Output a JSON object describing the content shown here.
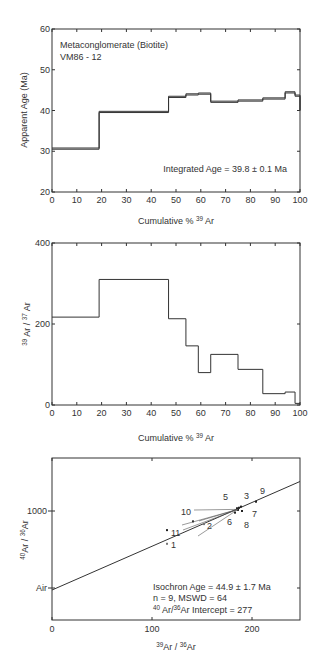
{
  "chart_data": [
    {
      "type": "line",
      "subtype": "step",
      "title": "",
      "annotation_lines": [
        "Metaconglomerate (Biotite)",
        "VM86 - 12"
      ],
      "annotation_result": "Integrated Age = 39.8 ± 0.1 Ma",
      "xlabel": "Cumulative % 39 Ar",
      "xlabel_main": "Cumulative % ",
      "xlabel_sup": "39",
      "xlabel_tail": " Ar",
      "ylabel": "Apparent Age (Ma)",
      "xlim": [
        0,
        100
      ],
      "ylim": [
        20,
        60
      ],
      "xticks": [
        0,
        10,
        20,
        30,
        40,
        50,
        60,
        70,
        80,
        90,
        100
      ],
      "yticks": [
        20,
        30,
        40,
        50,
        60
      ],
      "steps": [
        {
          "x0": 0,
          "x1": 19,
          "y": 30.5
        },
        {
          "x0": 19,
          "x1": 47,
          "y": 39.5
        },
        {
          "x0": 47,
          "x1": 54,
          "y": 43.2
        },
        {
          "x0": 54,
          "x1": 59,
          "y": 43.8
        },
        {
          "x0": 59,
          "x1": 64,
          "y": 44.0
        },
        {
          "x0": 64,
          "x1": 75,
          "y": 42.0
        },
        {
          "x0": 75,
          "x1": 85,
          "y": 42.3
        },
        {
          "x0": 85,
          "x1": 94,
          "y": 42.8
        },
        {
          "x0": 94,
          "x1": 98,
          "y": 44.3
        },
        {
          "x0": 98,
          "x1": 100,
          "y": 43.5
        }
      ],
      "final_drop_to": 40.0,
      "grid": false
    },
    {
      "type": "line",
      "subtype": "step",
      "title": "",
      "xlabel": "Cumulative % 39 Ar",
      "xlabel_main": "Cumulative % ",
      "xlabel_sup": "39",
      "xlabel_tail": " Ar",
      "ylabel": "39 Ar / 37 Ar",
      "ylabel_parts": {
        "sup1": "39",
        "t1": " Ar / ",
        "sup2": "37",
        "t2": " Ar"
      },
      "xlim": [
        0,
        100
      ],
      "ylim": [
        0,
        400
      ],
      "xticks": [
        0,
        10,
        20,
        30,
        40,
        50,
        60,
        70,
        80,
        90,
        100
      ],
      "yticks": [
        0,
        200,
        400
      ],
      "steps": [
        {
          "x0": 0,
          "x1": 19,
          "y": 217
        },
        {
          "x0": 19,
          "x1": 47,
          "y": 310
        },
        {
          "x0": 47,
          "x1": 54,
          "y": 213
        },
        {
          "x0": 54,
          "x1": 59,
          "y": 146
        },
        {
          "x0": 59,
          "x1": 64,
          "y": 80
        },
        {
          "x0": 64,
          "x1": 75,
          "y": 125
        },
        {
          "x0": 75,
          "x1": 85,
          "y": 88
        },
        {
          "x0": 85,
          "x1": 94,
          "y": 28
        },
        {
          "x0": 94,
          "x1": 98,
          "y": 32
        },
        {
          "x0": 98,
          "x1": 100,
          "y": 4
        }
      ],
      "grid": false
    },
    {
      "type": "scatter",
      "title": "",
      "xlabel": "39Ar / 36Ar",
      "xlabel_parts": {
        "sup1": "39",
        "t1": "Ar / ",
        "sup2": "36",
        "t2": "Ar"
      },
      "ylabel": "40Ar / 36Ar",
      "ylabel_parts": {
        "sup1": "40",
        "t1": "Ar / ",
        "sup2": "36",
        "t2": "Ar"
      },
      "xlim": [
        0,
        248
      ],
      "ylim": [
        0,
        1450
      ],
      "xticks": [
        0,
        100,
        200
      ],
      "yticks": [
        {
          "value": 1000,
          "label": "1000"
        },
        {
          "value": 295.5,
          "label": "Air"
        }
      ],
      "points": [
        {
          "label": "1",
          "x": 115,
          "y": 700,
          "excluded": true
        },
        {
          "label": "2",
          "x": 152,
          "y": 880,
          "excluded": true
        },
        {
          "label": "3",
          "x": 189,
          "y": 1040,
          "excluded": false
        },
        {
          "label": "4",
          "x": 187,
          "y": 1030,
          "excluded": false
        },
        {
          "label": "5",
          "x": 185,
          "y": 1025,
          "excluded": false
        },
        {
          "label": "6",
          "x": 183,
          "y": 985,
          "excluded": false
        },
        {
          "label": "7",
          "x": 190,
          "y": 1000,
          "excluded": false
        },
        {
          "label": "8",
          "x": 186,
          "y": 1010,
          "excluded": false
        },
        {
          "label": "9",
          "x": 204,
          "y": 1085,
          "excluded": false
        },
        {
          "label": "10",
          "x": 141,
          "y": 905,
          "excluded": false
        },
        {
          "label": "11",
          "x": 115,
          "y": 825,
          "excluded": false
        }
      ],
      "regression": {
        "intercept": 277,
        "x_end": 248,
        "y_end": 1270
      },
      "annotation_lines": [
        "Isochron Age = 44.9 ± 1.7 Ma",
        "n = 9, MSWD = 64"
      ],
      "intercept_text": {
        "sup1": "40",
        "t1": " Ar/",
        "sup2": "36",
        "t2": "Ar Intercept = 277"
      },
      "grid": false
    }
  ]
}
